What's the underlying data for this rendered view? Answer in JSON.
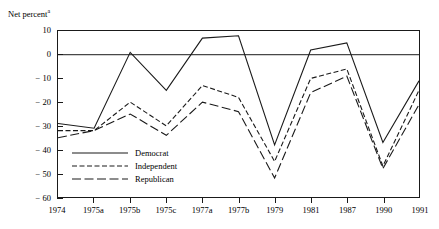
{
  "chart_data": {
    "type": "line",
    "title": "Net percent",
    "title_superscript": "a",
    "xlabel": "",
    "ylabel": "",
    "categories": [
      "1974",
      "1975a",
      "1975b",
      "1975c",
      "1977a",
      "1977b",
      "1979",
      "1981",
      "1987",
      "1990",
      "1991"
    ],
    "ylim": [
      -60,
      10
    ],
    "yticks": [
      10,
      0,
      -10,
      -20,
      -30,
      -40,
      -50,
      -60
    ],
    "ytick_labels": [
      "10",
      "0",
      "− 10",
      "− 20",
      "− 30",
      "− 40",
      "− 50",
      "− 60"
    ],
    "grid": false,
    "zero_line": true,
    "legend_position": "inside-lower-left",
    "series": [
      {
        "name": "Democrat",
        "style": "solid",
        "values": [
          -29,
          -31,
          1,
          -15,
          7,
          8,
          -38,
          2,
          5,
          -37,
          -11
        ]
      },
      {
        "name": "Independent",
        "style": "dashed",
        "values": [
          -32,
          -32,
          -20,
          -30,
          -13,
          -18,
          -45,
          -10,
          -6,
          -47,
          -15
        ]
      },
      {
        "name": "Republican",
        "style": "long-dashed",
        "values": [
          -35,
          -32,
          -25,
          -34,
          -20,
          -24,
          -52,
          -16,
          -9,
          -48,
          -21
        ]
      }
    ]
  },
  "legend": {
    "items": [
      {
        "label": "Democrat"
      },
      {
        "label": "Independent"
      },
      {
        "label": "Republican"
      }
    ]
  },
  "colors": {
    "line": "#1a1a1a",
    "frame": "#1a1a1a",
    "background": "#ffffff"
  }
}
